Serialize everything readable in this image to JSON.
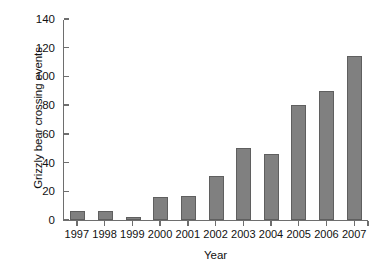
{
  "chart_data": {
    "type": "bar",
    "title": "",
    "xlabel": "Year",
    "ylabel": "Grizzly bear crossing events",
    "categories": [
      "1997",
      "1998",
      "1999",
      "2000",
      "2001",
      "2002",
      "2003",
      "2004",
      "2005",
      "2006",
      "2007"
    ],
    "values": [
      6,
      6,
      2,
      16,
      17,
      31,
      50,
      46,
      80,
      90,
      114
    ],
    "series": [
      {
        "name": "Grizzly bear crossing events",
        "values": [
          6,
          6,
          2,
          16,
          17,
          31,
          50,
          46,
          80,
          90,
          114
        ]
      }
    ],
    "ylim": [
      0,
      140
    ],
    "ytick_labels": [
      "0",
      "20",
      "40",
      "60",
      "80",
      "100",
      "120",
      "140"
    ],
    "ytick_values": [
      0,
      20,
      40,
      60,
      80,
      100,
      120,
      140
    ],
    "grid": false,
    "legend": false,
    "legend_position": "none",
    "bar_color": "#808080",
    "bar_border_color": "#5f5f5f",
    "axis_color": "#6e6e6e",
    "background_color": "#ffffff",
    "text_color": "#111111"
  }
}
